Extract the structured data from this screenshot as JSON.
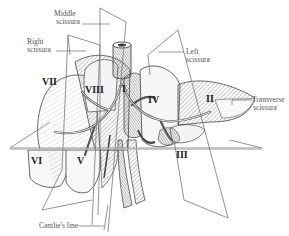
{
  "diagram": {
    "labels": {
      "middle_scissura": [
        "Middle",
        "scissura"
      ],
      "right_scissura": [
        "Right",
        "scissura"
      ],
      "left_scissura": [
        "Left",
        "scissura"
      ],
      "transverse_scissura": [
        "Transverse",
        "scissura"
      ],
      "cantlies_line": "Cantlie's line"
    },
    "segments": {
      "I": "I",
      "II": "II",
      "III": "III",
      "IV": "IV",
      "V": "V",
      "VI": "VI",
      "VII": "VII",
      "VIII": "VIII"
    },
    "colors": {
      "line": "#777777",
      "ink": "#333333",
      "hatch_light": "#bbbbbb",
      "hatch_dark": "#666666",
      "background": "#ffffff"
    }
  }
}
